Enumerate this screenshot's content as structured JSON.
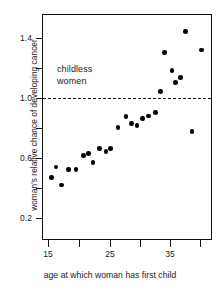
{
  "chart_data": {
    "type": "scatter",
    "title": "",
    "xlabel": "age at which woman has first child",
    "ylabel": "woman's relative chance of developing cancer",
    "xlim": [
      13.6,
      41.5
    ],
    "ylim": [
      0.06,
      1.53
    ],
    "xticks": [
      15,
      20,
      25,
      30,
      35,
      40
    ],
    "xtick_labels": [
      "15",
      "",
      "25",
      "",
      "35",
      ""
    ],
    "yticks": [
      0.2,
      0.4,
      0.6,
      0.8,
      1.0,
      1.2,
      1.4
    ],
    "ytick_labels": [
      "0.2",
      "",
      "0.6",
      "",
      "1.0",
      "",
      "1.4"
    ],
    "grid": false,
    "legend": null,
    "annotations": [
      {
        "text_line1": "childless",
        "text_line2": "women",
        "x": 16.4,
        "y": 1.18
      }
    ],
    "reference_lines": [
      {
        "y": 1.0,
        "style": "dashed",
        "label": "childless women baseline"
      }
    ],
    "points": [
      {
        "x": 15.6,
        "y": 0.47
      },
      {
        "x": 16.3,
        "y": 0.54
      },
      {
        "x": 17.2,
        "y": 0.42
      },
      {
        "x": 18.4,
        "y": 0.525
      },
      {
        "x": 19.6,
        "y": 0.525
      },
      {
        "x": 20.8,
        "y": 0.615
      },
      {
        "x": 21.6,
        "y": 0.63
      },
      {
        "x": 22.4,
        "y": 0.57
      },
      {
        "x": 23.4,
        "y": 0.665
      },
      {
        "x": 24.5,
        "y": 0.645
      },
      {
        "x": 25.2,
        "y": 0.665
      },
      {
        "x": 26.5,
        "y": 0.805
      },
      {
        "x": 27.8,
        "y": 0.875
      },
      {
        "x": 28.7,
        "y": 0.83
      },
      {
        "x": 29.6,
        "y": 0.815
      },
      {
        "x": 30.5,
        "y": 0.865
      },
      {
        "x": 31.5,
        "y": 0.88
      },
      {
        "x": 32.6,
        "y": 0.905
      },
      {
        "x": 33.4,
        "y": 1.045
      },
      {
        "x": 34.1,
        "y": 1.305
      },
      {
        "x": 35.3,
        "y": 1.185
      },
      {
        "x": 35.9,
        "y": 1.105
      },
      {
        "x": 36.7,
        "y": 1.135
      },
      {
        "x": 37.5,
        "y": 1.445
      },
      {
        "x": 38.6,
        "y": 0.775
      },
      {
        "x": 40.2,
        "y": 1.32
      }
    ]
  },
  "axes": {
    "x_title": "age at which woman has first child",
    "y_title": "woman's relative chance of developing cancer"
  },
  "labels": {
    "y": [
      "1.4",
      "1.0",
      "0.6",
      "0.2"
    ],
    "x": [
      "15",
      "25",
      "35"
    ]
  },
  "annotation": {
    "line1": "childless",
    "line2": "women"
  },
  "colors": {
    "axis": "#111111",
    "point": "#000000",
    "refline": "#111111",
    "background": "#ffffff"
  }
}
